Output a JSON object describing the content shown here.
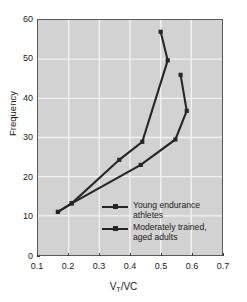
{
  "chart_data": {
    "type": "line",
    "title": "",
    "xlabel": "VT/VC",
    "xlabel_main": "V",
    "xlabel_sub": "T",
    "xlabel_rest": "/VC",
    "ylabel": "Frequency",
    "xlim": [
      0.1,
      0.7
    ],
    "ylim": [
      0,
      60
    ],
    "xticks": [
      0.1,
      0.2,
      0.3,
      0.4,
      0.5,
      0.6,
      0.7
    ],
    "xtick_labels": [
      "0.1",
      "0.2",
      "0.3",
      "0.4",
      "0.5",
      "0.6",
      "0.7"
    ],
    "yticks": [
      0,
      10,
      20,
      30,
      40,
      50,
      60
    ],
    "ytick_labels": [
      "0",
      "10",
      "20",
      "30",
      "40",
      "50",
      "60"
    ],
    "grid": true,
    "grid_color": "#f2f2f2",
    "plot_bgcolor": "#d2d2d2",
    "line_color": "#262626",
    "legend_position": "inside-lower-center",
    "series": [
      {
        "name": "Young endurance athletes",
        "marker": "square",
        "x": [
          0.165,
          0.21,
          0.365,
          0.44,
          0.523,
          0.5
        ],
        "y": [
          11.0,
          13.2,
          24.3,
          28.9,
          49.7,
          57.0
        ]
      },
      {
        "name": "Moderately trained, aged adults",
        "marker": "square",
        "x": [
          0.165,
          0.21,
          0.435,
          0.548,
          0.585,
          0.565
        ],
        "y": [
          11.0,
          13.2,
          23.0,
          29.5,
          36.8,
          46.0
        ]
      }
    ]
  },
  "legend": {
    "items": [
      {
        "label": "Young endurance athletes"
      },
      {
        "label": "Moderately trained,\naged adults"
      }
    ]
  }
}
